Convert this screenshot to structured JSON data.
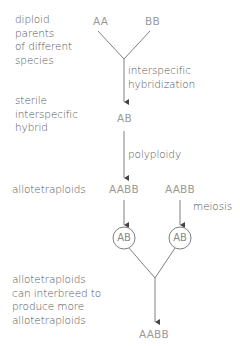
{
  "labels": {
    "parents": [
      "diploid",
      "parents",
      "of different",
      "species"
    ],
    "hybrid": [
      "sterile",
      "interspecific",
      "hybrid"
    ],
    "allotetraploids": "allotetraploids",
    "interbreed": [
      "allotetraploids",
      "can interbreed to",
      "produce more",
      "allotetraploids"
    ]
  },
  "process_labels": {
    "hybridization": [
      "interspecific",
      "hybridization"
    ],
    "polyploidy": "polyploidy",
    "meiosis": "meiosis"
  },
  "genotypes": {
    "parent_a": "AA",
    "parent_b": "BB",
    "hybrid": "AB",
    "tetraploid_left": "AABB",
    "tetraploid_right": "AABB",
    "gamete_left": "AB",
    "gamete_right": "AB",
    "offspring": "AABB"
  },
  "colors": {
    "line": "#808080",
    "label_text": "#555555",
    "genotype_text": "#9a9a9a"
  }
}
